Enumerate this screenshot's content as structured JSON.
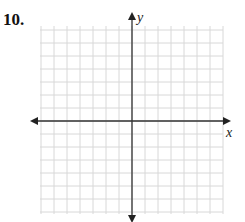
{
  "problem": {
    "number_label": "10."
  },
  "axes": {
    "x_label": "x",
    "y_label": "y"
  },
  "grid": {
    "left": 40,
    "top": 26,
    "right": 223,
    "bottom": 214,
    "origin_x": 132,
    "origin_y": 121,
    "cell_size": 13,
    "grid_color": "#d8d8d8",
    "axis_color": "#333333"
  },
  "chart_data": {
    "type": "scatter",
    "title": "",
    "xlabel": "x",
    "ylabel": "y",
    "x": [],
    "y": [],
    "grid": true,
    "note": "Blank coordinate plane with gridlines, no plotted points; axes with arrows in both directions"
  }
}
